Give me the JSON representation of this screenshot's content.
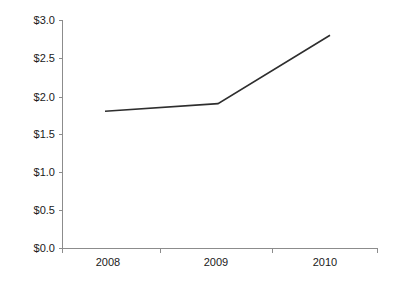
{
  "chart_data": {
    "type": "line",
    "title": "",
    "subtitle": "",
    "xlabel": "",
    "ylabel": "",
    "categories": [
      "2008",
      "2009",
      "2010"
    ],
    "x": [
      2008,
      2009,
      2010
    ],
    "values": [
      1.8,
      1.9,
      2.8
    ],
    "series": [
      {
        "name": "",
        "values": [
          1.8,
          1.9,
          2.8
        ],
        "color": "#2e2e2e"
      }
    ],
    "ylim": [
      0.0,
      3.0
    ],
    "ytick_values": [
      0.0,
      0.5,
      1.0,
      1.5,
      2.0,
      2.5,
      3.0
    ],
    "ytick_labels": [
      "$0.0",
      "$0.5",
      "$1.0",
      "$1.5",
      "$2.0",
      "$2.5",
      "$3.0"
    ],
    "xtick_labels": [
      "2008",
      "2009",
      "2010"
    ],
    "grid": false,
    "legend": false,
    "legend_position": "none",
    "value_prefix": "$",
    "axis_color": "#8c8c8c",
    "line_color": "#2e2e2e",
    "background_color": "#ffffff",
    "text_color": "#1a1a1a",
    "markers": false,
    "annotations": []
  },
  "plot_geometry": {
    "left": 62,
    "right": 378,
    "top": 20,
    "bottom": 248,
    "x_positions": [
      105,
      218,
      330
    ],
    "x_tick_positions": [
      62,
      160,
      272,
      378
    ],
    "x_label_positions": [
      108,
      216,
      325
    ],
    "y_tick_positions": [
      248,
      210,
      172,
      134,
      97,
      58,
      20
    ],
    "y_label_x": 55,
    "x_label_y": 266,
    "tick_length": 4
  }
}
